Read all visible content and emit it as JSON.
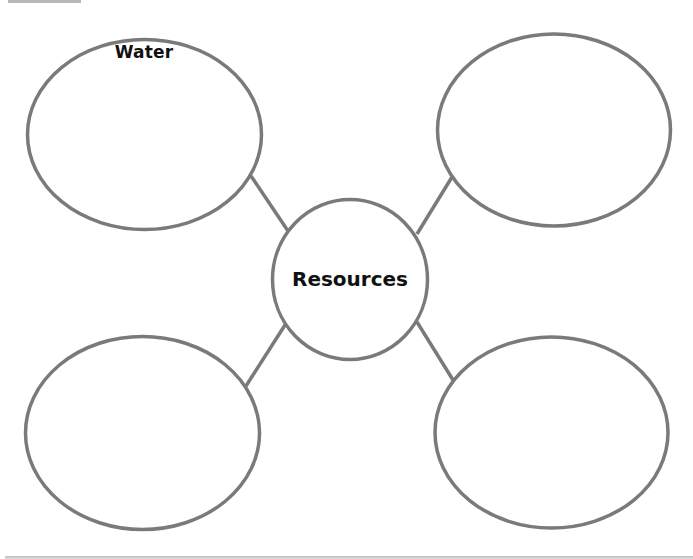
{
  "diagram": {
    "type": "bubble-map",
    "center": {
      "label": "Resources"
    },
    "bubbles": [
      {
        "position": "top-left",
        "label": "Water"
      },
      {
        "position": "top-right",
        "label": ""
      },
      {
        "position": "bottom-left",
        "label": ""
      },
      {
        "position": "bottom-right",
        "label": ""
      }
    ],
    "stroke_color": "#7a7a7a",
    "background_color": "#ffffff"
  }
}
